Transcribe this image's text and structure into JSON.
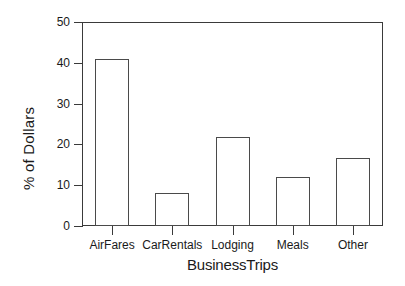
{
  "chart_data": {
    "type": "bar",
    "title": "",
    "xlabel": "BusinessTrips",
    "ylabel": "% of Dollars",
    "categories": [
      "AirFares",
      "CarRentals",
      "Lodging",
      "Meals",
      "Other"
    ],
    "values": [
      41,
      8,
      21.7,
      12,
      16.7
    ],
    "ylim": [
      0,
      50
    ],
    "yticks": [
      0,
      10,
      20,
      30,
      40,
      50
    ],
    "ytick_labels": [
      "0",
      "10",
      "20",
      "30",
      "40",
      "50"
    ],
    "grid": false,
    "legend": false,
    "legend_position": "none",
    "series": [
      {
        "name": "% of Dollars",
        "values": [
          41,
          8,
          21.7,
          12,
          16.7
        ]
      }
    ],
    "style": {
      "bar_fill": "#ffffff",
      "bar_edge": "#4a4a4a",
      "frame_color": "#3a3a3a",
      "background": "#ffffff",
      "text_color": "#1a1a1a"
    }
  }
}
